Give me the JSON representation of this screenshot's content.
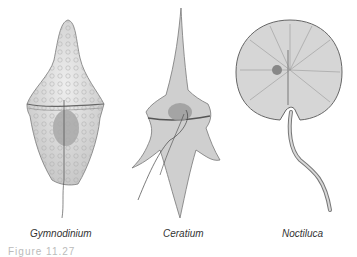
{
  "figure": {
    "caption": "Figure 11.27",
    "organisms": [
      {
        "name": "Gymnodinium"
      },
      {
        "name": "Ceratium"
      },
      {
        "name": "Noctiluca"
      }
    ]
  }
}
